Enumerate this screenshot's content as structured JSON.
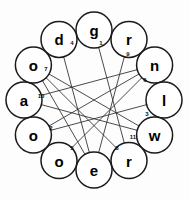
{
  "diagram": {
    "type": "circular-graph",
    "background_color": "#fdfdfd",
    "node_fill": "#ffffff",
    "node_stroke": "#1a1a1a",
    "edge_color": "#2a2a2a",
    "center_x": 94,
    "center_y": 100,
    "ring_radius": 70,
    "node_radius": 18,
    "nodes": [
      {
        "id": "n0",
        "label": "g",
        "angle": -90,
        "cx": 94,
        "cy": 30
      },
      {
        "id": "n1",
        "label": "r",
        "angle": -60,
        "cx": 129,
        "cy": 39.4
      },
      {
        "id": "n2",
        "label": "n",
        "angle": -30,
        "cx": 154.6,
        "cy": 65
      },
      {
        "id": "n3",
        "label": "l",
        "angle": 0,
        "cx": 164,
        "cy": 100
      },
      {
        "id": "n4",
        "label": "w",
        "angle": 30,
        "cx": 154.6,
        "cy": 135
      },
      {
        "id": "n5",
        "label": "r",
        "angle": 60,
        "cx": 129,
        "cy": 160.6
      },
      {
        "id": "n6",
        "label": "e",
        "angle": 90,
        "cx": 94,
        "cy": 170
      },
      {
        "id": "n7",
        "label": "o",
        "angle": 120,
        "cx": 59,
        "cy": 160.6
      },
      {
        "id": "n8",
        "label": "o",
        "angle": 150,
        "cx": 33.4,
        "cy": 135
      },
      {
        "id": "n9",
        "label": "a",
        "angle": 180,
        "cx": 24,
        "cy": 100
      },
      {
        "id": "n10",
        "label": "o",
        "angle": -150,
        "cx": 33.4,
        "cy": 65
      },
      {
        "id": "n11",
        "label": "d",
        "angle": -120,
        "cx": 59,
        "cy": 39.4
      }
    ],
    "rim_edges": [
      {
        "from": "n0",
        "to": "n1"
      },
      {
        "from": "n1",
        "to": "n2"
      },
      {
        "from": "n2",
        "to": "n3"
      },
      {
        "from": "n3",
        "to": "n4"
      },
      {
        "from": "n4",
        "to": "n5"
      },
      {
        "from": "n5",
        "to": "n6"
      },
      {
        "from": "n6",
        "to": "n7"
      },
      {
        "from": "n7",
        "to": "n8"
      },
      {
        "from": "n8",
        "to": "n9"
      },
      {
        "from": "n9",
        "to": "n10"
      },
      {
        "from": "n10",
        "to": "n11"
      },
      {
        "from": "n11",
        "to": "n0"
      }
    ],
    "chords": [
      {
        "number": "1",
        "from": "n0",
        "to": "n5",
        "label_x": 101,
        "label_y": 43
      },
      {
        "number": "2",
        "from": "n8",
        "to": "n2",
        "label_x": 51,
        "label_y": 128
      },
      {
        "number": "3",
        "from": "n3",
        "to": "n8",
        "label_x": 147,
        "label_y": 114
      },
      {
        "number": "4",
        "from": "n11",
        "to": "n6",
        "label_x": 72,
        "label_y": 43
      },
      {
        "number": "5",
        "from": "n6",
        "to": "n10",
        "label_x": 72,
        "label_y": 148
      },
      {
        "number": "6",
        "from": "n2",
        "to": "n7",
        "label_x": 145,
        "label_y": 80
      },
      {
        "number": "7",
        "from": "n9",
        "to": "n2",
        "label_x": 46,
        "label_y": 69
      },
      {
        "number": "8",
        "from": "n5",
        "to": "n10",
        "label_x": 117,
        "label_y": 148
      },
      {
        "number": "9",
        "from": "n1",
        "to": "n6",
        "label_x": 128,
        "label_y": 54
      },
      {
        "number": "10",
        "from": "n10",
        "to": "n4",
        "label_x": 41,
        "label_y": 96
      },
      {
        "number": "11",
        "from": "n4",
        "to": "n9",
        "label_x": 133,
        "label_y": 137
      }
    ]
  }
}
